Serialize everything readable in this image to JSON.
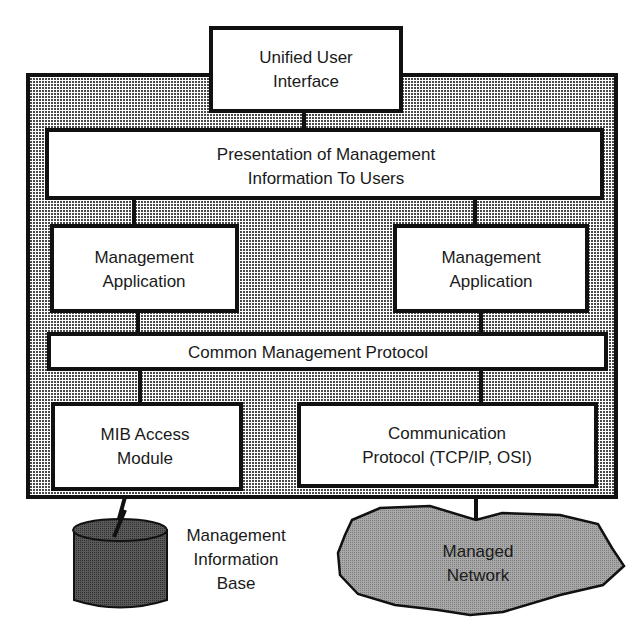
{
  "diagram": {
    "colors": {
      "background": "#ffffff",
      "frame_fill_dots": "#3a3a3a",
      "box_fill": "#ffffff",
      "stroke": "#111111",
      "database_fill": "#4a4a4a",
      "network_fill": "#9a9a9a"
    },
    "nodes": {
      "unified_ui": {
        "line1": "Unified User",
        "line2": "Interface"
      },
      "presentation": {
        "line1": "Presentation of Management",
        "line2": "Information To Users"
      },
      "mgmt_app_left": {
        "line1": "Management",
        "line2": "Application"
      },
      "mgmt_app_right": {
        "line1": "Management",
        "line2": "Application"
      },
      "common_protocol": {
        "line1": "Common Management Protocol"
      },
      "mib_access": {
        "line1": "MIB Access",
        "line2": "Module"
      },
      "comm_protocol": {
        "line1": "Communication",
        "line2": "Protocol (TCP/IP, OSI)"
      },
      "mib_database": {
        "line1": "Management",
        "line2": "Information",
        "line3": "Base",
        "icon": "database-cylinder-icon"
      },
      "managed_network": {
        "line1": "Managed",
        "line2": "Network",
        "icon": "cloud-icon"
      }
    },
    "edges": [
      {
        "from": "unified_ui",
        "to": "presentation"
      },
      {
        "from": "presentation",
        "to": "mgmt_app_left"
      },
      {
        "from": "presentation",
        "to": "mgmt_app_right"
      },
      {
        "from": "mgmt_app_left",
        "to": "common_protocol"
      },
      {
        "from": "mgmt_app_right",
        "to": "common_protocol"
      },
      {
        "from": "common_protocol",
        "to": "mib_access"
      },
      {
        "from": "common_protocol",
        "to": "comm_protocol"
      },
      {
        "from": "mib_access",
        "to": "mib_database"
      },
      {
        "from": "comm_protocol",
        "to": "managed_network"
      }
    ]
  }
}
